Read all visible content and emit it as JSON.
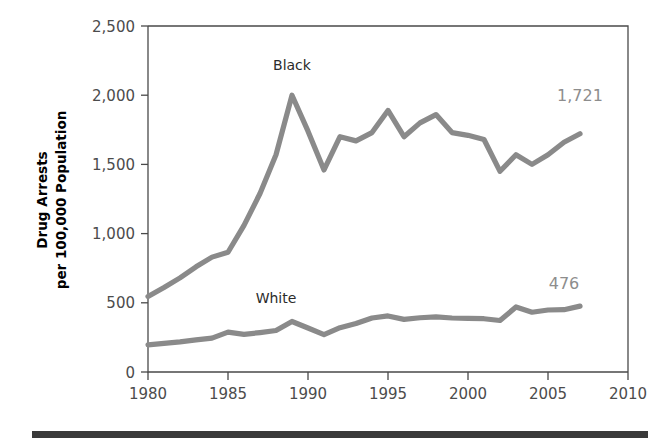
{
  "figure": {
    "ylabel_line1": "Drug Arrests",
    "ylabel_line2": "per 100,000 Population",
    "footer_rule_color": "#3a3a3a",
    "line_color": "#8a8a8a",
    "axis_color": "#4a4a4a"
  },
  "chart_data": {
    "type": "line",
    "title": "",
    "xlabel": "",
    "ylabel": "Drug Arrests per 100,000 Population",
    "xlim": [
      1980,
      2010
    ],
    "ylim": [
      0,
      2500
    ],
    "xticks": [
      1980,
      1985,
      1990,
      1995,
      2000,
      2005,
      2010
    ],
    "xtick_labels": [
      "1980",
      "1985",
      "1990",
      "1995",
      "2000",
      "2005",
      "2010"
    ],
    "yticks": [
      0,
      500,
      1000,
      1500,
      2000,
      2500
    ],
    "ytick_labels": [
      "0",
      "500",
      "1,000",
      "1,500",
      "2,000",
      "2,500"
    ],
    "grid": false,
    "legend": "inline-labels",
    "x": [
      1980,
      1981,
      1982,
      1983,
      1984,
      1985,
      1986,
      1987,
      1988,
      1989,
      1990,
      1991,
      1992,
      1993,
      1994,
      1995,
      1996,
      1997,
      1998,
      1999,
      2000,
      2001,
      2002,
      2003,
      2004,
      2005,
      2006,
      2007
    ],
    "series": [
      {
        "name": "Black",
        "label": "Black",
        "color": "#8a8a8a",
        "label_x": 1989,
        "label_y": 2180,
        "end_label": "1,721",
        "end_label_x": 2007,
        "end_label_y": 1960,
        "values": [
          545,
          610,
          680,
          760,
          830,
          865,
          1060,
          1290,
          1570,
          2000,
          1740,
          1460,
          1700,
          1670,
          1730,
          1890,
          1700,
          1800,
          1860,
          1730,
          1710,
          1680,
          1450,
          1570,
          1500,
          1570,
          1660,
          1721
        ]
      },
      {
        "name": "White",
        "label": "White",
        "color": "#8a8a8a",
        "label_x": 1988,
        "label_y": 500,
        "end_label": "476",
        "end_label_x": 2006,
        "end_label_y": 600,
        "values": [
          196,
          207,
          218,
          232,
          245,
          288,
          272,
          285,
          300,
          365,
          318,
          270,
          320,
          350,
          390,
          405,
          380,
          392,
          398,
          390,
          388,
          385,
          372,
          470,
          432,
          448,
          450,
          476
        ]
      }
    ],
    "annotations": [
      {
        "text": "Black",
        "type": "series-label"
      },
      {
        "text": "White",
        "type": "series-label"
      },
      {
        "text": "1,721",
        "type": "end-value"
      },
      {
        "text": "476",
        "type": "end-value"
      }
    ]
  }
}
